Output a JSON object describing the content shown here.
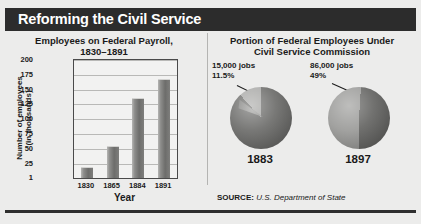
{
  "header": {
    "title": "Reforming the Civil Service"
  },
  "left_panel": {
    "title_line1": "Employees on Federal Payroll,",
    "title_line2": "1830–1891",
    "ylabel_line1": "Number of employees",
    "ylabel_line2": "(in thousands)",
    "xlabel": "Year"
  },
  "right_panel": {
    "title_line1": "Portion of Federal Employees Under",
    "title_line2": "Civil Service Commission",
    "pies": [
      {
        "year": "1883",
        "jobs": "15,000 jobs",
        "percent": "11.5%"
      },
      {
        "year": "1897",
        "jobs": "86,000 jobs",
        "percent": "49%"
      }
    ]
  },
  "source": {
    "label": "SOURCE:",
    "value": "U.S. Department of State"
  },
  "chart_data": [
    {
      "type": "bar",
      "title": "Employees on Federal Payroll, 1830–1891",
      "xlabel": "Year",
      "ylabel": "Number of employees (in thousands)",
      "categories": [
        "1830",
        "1865",
        "1884",
        "1891"
      ],
      "values": [
        18,
        53,
        135,
        166
      ],
      "yticks": [
        1,
        25,
        50,
        75,
        100,
        125,
        150,
        175,
        200
      ],
      "ylim": [
        1,
        200
      ],
      "grid": true,
      "legend": "none"
    },
    {
      "type": "pie",
      "title": "Portion of Federal Employees Under Civil Service Commission",
      "subtitle": "1883",
      "labels": [
        "Under Civil Service Commission",
        "Not under Civil Service Commission"
      ],
      "values": [
        11.5,
        88.5
      ],
      "annotation": "15,000 jobs 11.5%"
    },
    {
      "type": "pie",
      "title": "Portion of Federal Employees Under Civil Service Commission",
      "subtitle": "1897",
      "labels": [
        "Under Civil Service Commission",
        "Not under Civil Service Commission"
      ],
      "values": [
        49,
        51
      ],
      "annotation": "86,000 jobs 49%"
    }
  ],
  "colors": {
    "header_band": "#2c2c2c",
    "page_background": "#ececeb",
    "bar_fill": "#7e7e7c",
    "text": "#1a1a1a"
  }
}
